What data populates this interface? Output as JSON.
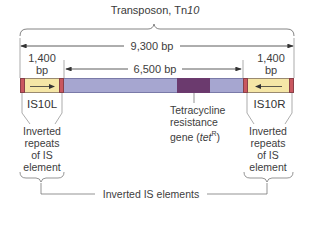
{
  "title": {
    "prefix": "Transposon, Tn",
    "italic": "10"
  },
  "dimensions": {
    "total": "9,300 bp",
    "central": "6,500 bp",
    "left_is_length_line1": "1,400",
    "left_is_length_line2": "bp",
    "right_is_length_line1": "1,400",
    "right_is_length_line2": "bp"
  },
  "elements": {
    "left_is": "IS10L",
    "right_is": "IS10R"
  },
  "gene_label": {
    "line1": "Tetracycline",
    "line2": "resistance",
    "line3_prefix": "gene (",
    "line3_italic": "tet",
    "line3_sup": "R",
    "line3_suffix": ")"
  },
  "inverted_repeats_left": {
    "line1": "Inverted",
    "line2": "repeats",
    "line3": "of IS",
    "line4": "element"
  },
  "inverted_repeats_right": {
    "line1": "Inverted",
    "line2": "repeats",
    "line3": "of IS",
    "line4": "element"
  },
  "bottom_label": "Inverted IS elements",
  "colors": {
    "repeat_red": "#c9575f",
    "is_yellow": "#f5e6a6",
    "central_blue": "#a6a6d0",
    "tet_purple": "#6b3a6e",
    "line": "#555555"
  }
}
